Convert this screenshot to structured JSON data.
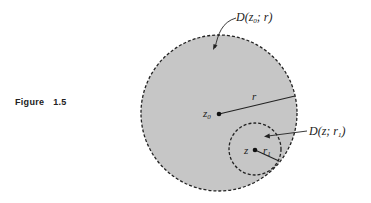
{
  "figure": {
    "label": "Figure 1.5",
    "label_word": "Figure",
    "label_number": "1.5"
  },
  "diagram": {
    "outer_disk": {
      "label": "D(z₀; r)",
      "label_parts": {
        "D": "D(",
        "z": "z",
        "sub": "0",
        "rest": "; r)"
      },
      "center_label": "z₀",
      "center_label_main": "z",
      "center_label_sub": "0",
      "radius_label": "r",
      "fill": "#c8c8c8",
      "stroke": "#222222"
    },
    "inner_disk": {
      "label": "D(z; r₁)",
      "label_parts": {
        "D": "D(z; ",
        "r": "r",
        "sub": "1",
        "rest": ")"
      },
      "center_label": "z",
      "radius_label": "r₁",
      "radius_label_main": "r",
      "radius_label_sub": "1",
      "stroke": "#222222"
    }
  }
}
